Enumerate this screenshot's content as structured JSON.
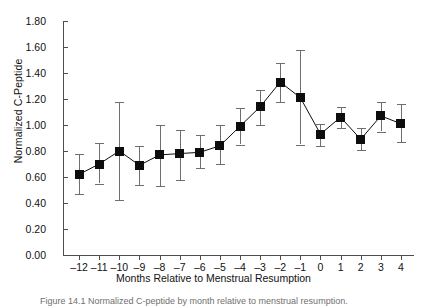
{
  "chart_data": {
    "type": "scatter",
    "title": "",
    "xlabel": "Months Relative to Menstrual Resumption",
    "ylabel": "Normalized C-Peptide",
    "xlim": [
      -12.8,
      4.6
    ],
    "ylim": [
      0.0,
      1.8
    ],
    "grid": false,
    "legend": null,
    "error_bars": "visible",
    "marker": "filled-square",
    "x": [
      -12,
      -11,
      -10,
      -9,
      -8,
      -7,
      -6,
      -5,
      -4,
      -3,
      -2,
      -1,
      0,
      1,
      2,
      3,
      4
    ],
    "xtick_labels": [
      "–12",
      "–11",
      "–10",
      "–9",
      "–8",
      "–7",
      "–6",
      "–5",
      "–4",
      "–3",
      "–2",
      "–1",
      "0",
      "1",
      "2",
      "3",
      "4"
    ],
    "ytick_labels": [
      "0.00",
      "0.20",
      "0.40",
      "0.60",
      "0.80",
      "1.00",
      "1.20",
      "1.40",
      "1.60",
      "1.80"
    ],
    "ytick_values": [
      0.0,
      0.2,
      0.4,
      0.6,
      0.8,
      1.0,
      1.2,
      1.4,
      1.6,
      1.8
    ],
    "values": [
      0.62,
      0.7,
      0.8,
      0.69,
      0.77,
      0.78,
      0.79,
      0.84,
      0.99,
      1.14,
      1.33,
      1.21,
      0.93,
      1.06,
      0.89,
      1.07,
      1.01
    ],
    "err_low": [
      0.47,
      0.55,
      0.42,
      0.54,
      0.53,
      0.58,
      0.67,
      0.7,
      0.85,
      1.0,
      1.18,
      0.85,
      0.84,
      0.98,
      0.81,
      0.95,
      0.87
    ],
    "err_high": [
      0.78,
      0.86,
      1.18,
      0.84,
      1.0,
      0.96,
      0.92,
      1.0,
      1.13,
      1.27,
      1.48,
      1.58,
      1.01,
      1.14,
      0.98,
      1.18,
      1.16
    ],
    "series_name": "Normalized C-Peptide"
  },
  "caption": {
    "text": "Figure 14.1 Normalized C-peptide by month relative to menstrual resumption."
  },
  "colors": {
    "marker": "#0d0d0d",
    "error_bar": "#6e6e6e",
    "axis": "#4d4d4d",
    "text": "#111111",
    "background": "#ffffff"
  }
}
